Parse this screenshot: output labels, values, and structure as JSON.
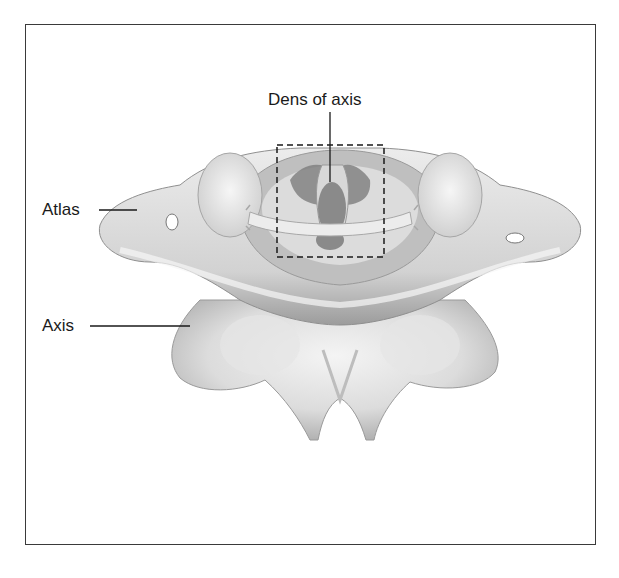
{
  "figure": {
    "labels": {
      "dens": "Dens of axis",
      "atlas": "Atlas",
      "axis": "Axis"
    },
    "highlight": "dashed-box-around-dens-and-transverse-ligament",
    "colors": {
      "frame": "#3a3a3a",
      "bone_light": "#e9e9e9",
      "bone_mid": "#cfcfcf",
      "bone_dark": "#9a9a9a",
      "dens": "#8a8a8a",
      "leader_line": "#1a1a1a"
    }
  }
}
